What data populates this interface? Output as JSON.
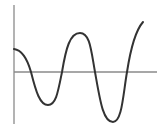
{
  "chart_data": {
    "type": "line",
    "title": "",
    "xlabel": "",
    "ylabel": "",
    "grid": false,
    "legend": null,
    "axes": {
      "y_axis": {
        "x": 14,
        "y_top": 5,
        "y_bottom": 124
      },
      "x_axis": {
        "y": 72,
        "x_left": 14,
        "x_right": 157
      }
    },
    "key_points": [
      {
        "label": "start",
        "x": 14,
        "y": 49
      },
      {
        "label": "zero-crossing-1",
        "x": 31,
        "y": 72
      },
      {
        "label": "trough-1",
        "x": 48,
        "y": 105
      },
      {
        "label": "zero-crossing-2",
        "x": 62,
        "y": 72
      },
      {
        "label": "peak-1",
        "x": 80,
        "y": 33
      },
      {
        "label": "zero-crossing-3",
        "x": 95,
        "y": 72
      },
      {
        "label": "trough-2",
        "x": 113,
        "y": 122
      },
      {
        "label": "zero-crossing-4",
        "x": 127,
        "y": 72
      },
      {
        "label": "end",
        "x": 143,
        "y": 22
      }
    ],
    "path": "M14,49 C22,50 27,58 31,72 C36,92 40,105 48,105 C56,105 58,92 62,72 C66,48 70,33 80,33 C90,33 91,50 95,72 C100,100 103,122 113,122 C122,122 123,95 127,72 C131,46 136,30 143,22"
  },
  "colors": {
    "axis": "#8a8a8a",
    "curve": "#333333",
    "background": "#ffffff"
  }
}
